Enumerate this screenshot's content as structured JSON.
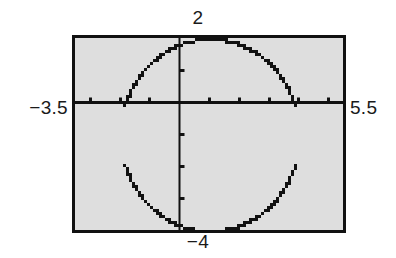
{
  "screen": {
    "device": "graphing-calculator",
    "background_color": "#dedede",
    "frame_color": "#111111",
    "page_background": "#ffffff"
  },
  "labels": {
    "ymax": "2",
    "ymin": "−4",
    "xmin": "−3.5",
    "xmax": "5.5"
  },
  "chart_data": {
    "type": "scatter",
    "title": "",
    "xlabel": "",
    "ylabel": "",
    "xlim": [
      -3.5,
      5.5
    ],
    "ylim": [
      -4,
      2
    ],
    "grid": false,
    "legend": false,
    "axes": {
      "x_axis_y_value": 0,
      "y_axis_x_value": 0,
      "x_tick_step": 1,
      "y_tick_step": 1,
      "x_ticks": [
        -3,
        -2,
        -1,
        1,
        2,
        3,
        4,
        5
      ],
      "y_ticks": [
        -3,
        -2,
        -1,
        1
      ],
      "tick_length_px": 5,
      "axis_color": "#111111"
    },
    "series": [
      {
        "name": "circle",
        "kind": "implicit-conic",
        "description": "dotted circle rendered by calculator as two semicircular branches with gaps at the horizontal extremes",
        "center": [
          1,
          -1
        ],
        "radius": 3,
        "equation": "(x-1)^2 + (y+1)^2 = 9",
        "x_domain": [
          -2,
          4
        ],
        "y_range": [
          -4,
          2
        ],
        "gap_at_endpoints": true,
        "color": "#111111",
        "dot_size_px": 3,
        "branches": [
          {
            "name": "upper-branch",
            "sign": "+",
            "y_expression": "-1 + sqrt(9 - (x-1)^2)"
          },
          {
            "name": "lower-branch",
            "sign": "-",
            "y_expression": "-1 - sqrt(9 - (x-1)^2)"
          }
        ]
      }
    ]
  }
}
